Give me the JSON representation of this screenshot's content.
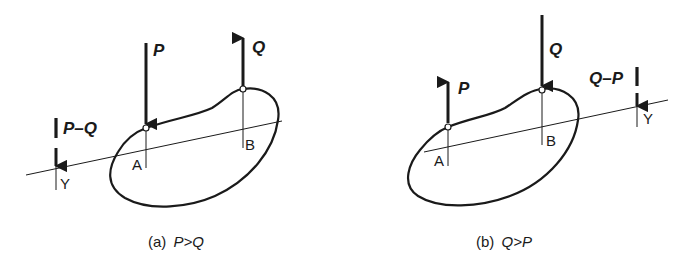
{
  "figures": [
    {
      "id": "a",
      "caption": {
        "prefix": "(a)",
        "condition": "P>Q"
      },
      "forces": {
        "P": {
          "label": "P",
          "direction": "down",
          "point": "A"
        },
        "Q": {
          "label": "Q",
          "direction": "up",
          "point": "B"
        },
        "resultant": {
          "label": "P–Q",
          "direction": "down",
          "point": "Y"
        }
      },
      "points": {
        "A": "A",
        "B": "B",
        "Y": "Y"
      }
    },
    {
      "id": "b",
      "caption": {
        "prefix": "(b)",
        "condition": "Q>P"
      },
      "forces": {
        "P": {
          "label": "P",
          "direction": "up",
          "point": "A"
        },
        "Q": {
          "label": "Q",
          "direction": "down",
          "point": "B"
        },
        "resultant": {
          "label": "Q–P",
          "direction": "down",
          "point": "Y"
        }
      },
      "points": {
        "A": "A",
        "B": "B",
        "Y": "Y"
      }
    }
  ],
  "colors": {
    "ink": "#1a1a1a",
    "background": "#ffffff"
  }
}
